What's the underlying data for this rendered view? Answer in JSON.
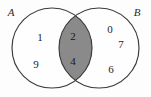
{
  "figure": {
    "type": "venn-diagram",
    "width": 151,
    "height": 97,
    "background_color": "#fdfdfd"
  },
  "sets": {
    "left": {
      "label": "A",
      "label_x": 11,
      "label_y": 16,
      "center_x": 52,
      "center_y": 48,
      "radius": 40
    },
    "right": {
      "label": "B",
      "label_x": 137,
      "label_y": 16,
      "center_x": 99,
      "center_y": 48,
      "radius": 40
    }
  },
  "style": {
    "outline_color": "#3a3a3a",
    "outline_width": 1.15,
    "intersection_fill": "#8a8a8a",
    "text_color": "#1c1c1c",
    "label_color": "#2b2b2b"
  },
  "regions": {
    "left_only": {
      "name": "A only",
      "elements": [
        {
          "value": "1",
          "x": 40,
          "y": 41
        },
        {
          "value": "9",
          "x": 36,
          "y": 68
        }
      ]
    },
    "intersection": {
      "name": "A intersect B",
      "shaded": true,
      "fill_color": "#8a8a8a",
      "elements": [
        {
          "value": "2",
          "x": 73,
          "y": 40
        },
        {
          "value": "4",
          "x": 73,
          "y": 65
        }
      ]
    },
    "right_only": {
      "name": "B only",
      "elements": [
        {
          "value": "0",
          "x": 110,
          "y": 33
        },
        {
          "value": "7",
          "x": 121,
          "y": 48
        },
        {
          "value": "6",
          "x": 111,
          "y": 73
        }
      ]
    }
  }
}
